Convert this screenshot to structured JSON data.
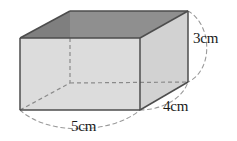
{
  "figure": {
    "name": "rectangular-prism",
    "background_color": "#ffffff"
  },
  "dimensions": {
    "height": {
      "label": "3cm",
      "value": 3,
      "unit": "cm",
      "edge": "vertical-right"
    },
    "depth": {
      "label": "4cm",
      "value": 4,
      "unit": "cm",
      "edge": "receding-right"
    },
    "width": {
      "label": "5cm",
      "value": 5,
      "unit": "cm",
      "edge": "bottom-front"
    }
  },
  "colors": {
    "front_face": "#dcdcdc",
    "right_face": "#d2d2d2",
    "top_rim": "#a8a8a8",
    "interior_back": "#8f8f8f",
    "interior_left": "#7a7a7a",
    "outline": "#4d4d4d",
    "hidden_edge": "#8a8a8a",
    "dimension_arc": "#9a9a9a",
    "text": "#1a1a1a"
  },
  "geometry": {
    "front_top_left": [
      20,
      38
    ],
    "front_top_right": [
      140,
      38
    ],
    "front_bottom_right": [
      140,
      110
    ],
    "front_bottom_left": [
      20,
      110
    ],
    "back_top_left": [
      70,
      11
    ],
    "back_top_right": [
      188,
      11
    ],
    "back_bottom_right": [
      188,
      82
    ],
    "back_bottom_left": [
      70,
      83
    ]
  }
}
